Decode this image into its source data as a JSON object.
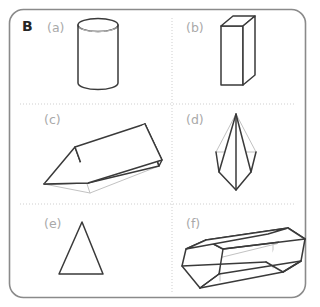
{
  "panel": {
    "section_letter": "B",
    "frame_color": "#8a8a8a",
    "divider_color": "#cfcfcf",
    "edge_color": "#3a3a3a",
    "hidden_edge_color": "#c2c2c2",
    "label_color": "#a9a9a9",
    "background": "#ffffff",
    "columns": 2,
    "rows": 3
  },
  "items": [
    {
      "label": "(a)",
      "shape": "cylinder",
      "cell": "row1-col1"
    },
    {
      "label": "(b)",
      "shape": "cuboid",
      "cell": "row1-col2"
    },
    {
      "label": "(c)",
      "shape": "triangular-prism",
      "cell": "row2-col1"
    },
    {
      "label": "(d)",
      "shape": "square-pyramid",
      "cell": "row2-col2"
    },
    {
      "label": "(e)",
      "shape": "tetrahedron",
      "cell": "row3-col1"
    },
    {
      "label": "(f)",
      "shape": "hexagonal-prism",
      "cell": "row3-col2"
    }
  ]
}
